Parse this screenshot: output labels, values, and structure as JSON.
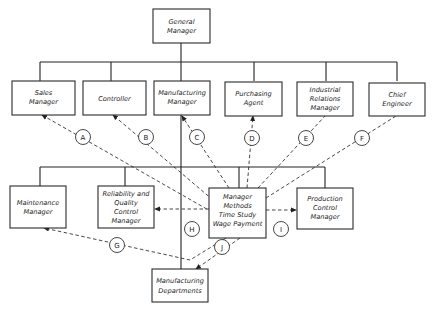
{
  "diagram": {
    "nodes": {
      "general_manager": [
        "General",
        "Manager"
      ],
      "sales_manager": [
        "Sales",
        "Manager"
      ],
      "controller": [
        "Controller"
      ],
      "manufacturing_manager": [
        "Manufacturing",
        "Manager"
      ],
      "purchasing_agent": [
        "Purchasing",
        "Agent"
      ],
      "industrial_relations_manager": [
        "Industrial",
        "Relations",
        "Manager"
      ],
      "chief_engineer": [
        "Chief",
        "Engineer"
      ],
      "maintenance_manager": [
        "Maintenance",
        "Manager"
      ],
      "reliability_quality_control_manager": [
        "Reliability and",
        "Quality",
        "Control",
        "Manager"
      ],
      "manager_methods": [
        "Manager",
        "Methods",
        "Time Study",
        "Wage Payment"
      ],
      "production_control_manager": [
        "Production",
        "Control",
        "Manager"
      ],
      "manufacturing_departments": [
        "Manufacturing",
        "Departments"
      ]
    },
    "labels": {
      "A": "A",
      "B": "B",
      "C": "C",
      "D": "D",
      "E": "E",
      "F": "F",
      "G": "G",
      "H": "H",
      "I": "I",
      "J": "J"
    },
    "solid_edges": [
      [
        "general_manager",
        "sales_manager"
      ],
      [
        "general_manager",
        "controller"
      ],
      [
        "general_manager",
        "manufacturing_manager"
      ],
      [
        "general_manager",
        "purchasing_agent"
      ],
      [
        "general_manager",
        "industrial_relations_manager"
      ],
      [
        "general_manager",
        "chief_engineer"
      ],
      [
        "manufacturing_manager",
        "maintenance_manager"
      ],
      [
        "manufacturing_manager",
        "reliability_quality_control_manager"
      ],
      [
        "manufacturing_manager",
        "manager_methods"
      ],
      [
        "manufacturing_manager",
        "production_control_manager"
      ],
      [
        "manufacturing_manager",
        "manufacturing_departments"
      ]
    ],
    "dashed_edges": [
      {
        "from": "manager_methods",
        "to": "sales_manager",
        "label": "A"
      },
      {
        "from": "manager_methods",
        "to": "controller",
        "label": "B"
      },
      {
        "from": "manager_methods",
        "to": "manufacturing_manager",
        "label": "C"
      },
      {
        "from": "manager_methods",
        "to": "purchasing_agent",
        "label": "D"
      },
      {
        "from": "manager_methods",
        "to": "industrial_relations_manager",
        "label": "E"
      },
      {
        "from": "manager_methods",
        "to": "chief_engineer",
        "label": "F"
      },
      {
        "from": "manager_methods",
        "to": "maintenance_manager",
        "label": "G"
      },
      {
        "from": "manager_methods",
        "to": "reliability_quality_control_manager",
        "label": "H"
      },
      {
        "from": "manager_methods",
        "to": "production_control_manager",
        "label": "I"
      },
      {
        "from": "manager_methods",
        "to": "manufacturing_departments",
        "label": "J"
      }
    ]
  }
}
